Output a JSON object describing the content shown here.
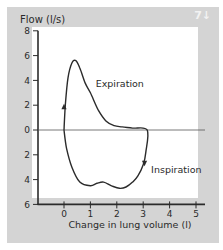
{
  "figure": {
    "number_label": "7↓"
  },
  "chart_data": {
    "type": "line",
    "title": "",
    "xlabel": "Change in lung volume (l)",
    "ylabel": "Flow (l/s)",
    "xlim": [
      -1,
      5.3
    ],
    "ylim": [
      -6,
      8
    ],
    "x_ticks": [
      0,
      1,
      2,
      3,
      4,
      5
    ],
    "x_tick_labels": [
      "0",
      "1",
      "2",
      "3",
      "4",
      "5"
    ],
    "y_ticks": [
      8,
      6,
      4,
      2,
      0,
      -2,
      -4,
      -6
    ],
    "y_tick_labels": [
      "8",
      "6",
      "4",
      "2",
      "0",
      "2",
      "4",
      "6"
    ],
    "grid": false,
    "reference_line": {
      "y": 0,
      "description": "zero-flow line"
    },
    "annotations": [
      {
        "text": "Expiration",
        "x": 1.2,
        "y": 3.5
      },
      {
        "text": "Inspiration",
        "x": 3.3,
        "y": -3.5
      }
    ],
    "series": [
      {
        "name": "Flow-volume loop",
        "x": [
          0.0,
          0.05,
          0.15,
          0.3,
          0.45,
          0.6,
          0.8,
          1.0,
          1.3,
          1.6,
          1.9,
          2.2,
          2.6,
          3.15,
          3.1,
          3.0,
          2.8,
          2.6,
          2.35,
          2.1,
          1.8,
          1.5,
          1.25,
          1.0,
          0.6,
          0.3,
          0.1,
          0.0
        ],
        "y": [
          0.0,
          2.0,
          4.2,
          5.4,
          5.6,
          5.0,
          3.8,
          3.0,
          1.6,
          0.7,
          0.35,
          0.25,
          0.15,
          0.0,
          -1.8,
          -2.8,
          -3.7,
          -4.2,
          -4.6,
          -4.7,
          -4.5,
          -4.2,
          -4.3,
          -4.5,
          -4.2,
          -3.0,
          -1.5,
          0.0
        ],
        "direction": "clockwise: expiration up-right to 3.15 L, inspiration back along negative flow",
        "arrows": [
          {
            "x": 0.0,
            "y": 1.8,
            "direction": "up"
          },
          {
            "x": 3.05,
            "y": -2.6,
            "direction": "down"
          }
        ]
      }
    ]
  }
}
